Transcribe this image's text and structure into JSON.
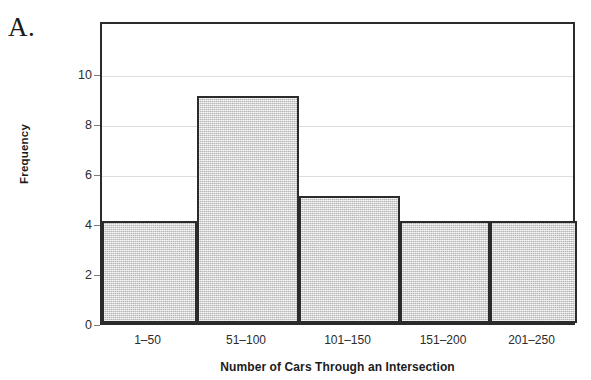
{
  "panel": {
    "letter": "A."
  },
  "chart_data": {
    "type": "bar",
    "title": "",
    "xlabel": "Number of Cars Through an Intersection",
    "ylabel": "Frequency",
    "categories": [
      "1–50",
      "51–100",
      "101–150",
      "151–200",
      "201–250"
    ],
    "values": [
      4,
      9,
      5,
      4,
      4
    ],
    "yticks": [
      0,
      2,
      4,
      6,
      8,
      10
    ],
    "ytick_labels": [
      "0",
      "2",
      "4",
      "6",
      "8",
      "10"
    ],
    "ylim": [
      0,
      12
    ],
    "xlim_bins": 5,
    "grid": true,
    "grid_axis": "y",
    "legend": null,
    "bar_fill_color": "#e0e0e0",
    "bar_edge_color": "#2b2b2b",
    "grid_color": "#dedede",
    "axis_color": "#2b2b2b",
    "background_color": "#ffffff"
  }
}
